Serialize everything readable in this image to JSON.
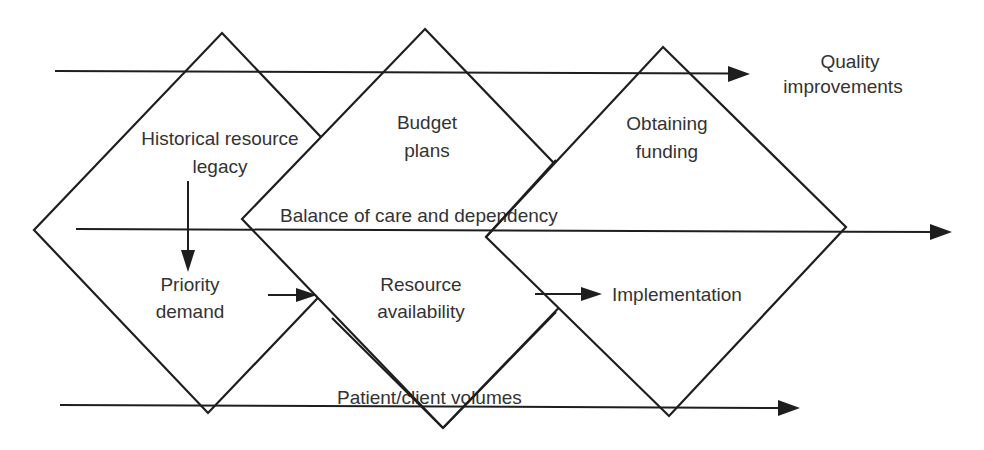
{
  "diagram": {
    "diamonds": [
      {
        "id": "historical",
        "points": "222,33 396,216 208,413 34,230",
        "label_lines": [
          "Historical resource",
          "legacy"
        ],
        "label_x": 220,
        "label_y": [
          145,
          173
        ]
      },
      {
        "id": "budget",
        "points": "425,29 626,238 443,428 242,219",
        "label_lines": [
          "Budget",
          "plans"
        ],
        "label_x": 427,
        "label_y": [
          129,
          157
        ]
      },
      {
        "id": "funding",
        "points": "663,47 846,227 669,416 486,237",
        "label_lines": [
          "Obtaining",
          "funding"
        ],
        "label_x": 667,
        "label_y": [
          130,
          158
        ]
      }
    ],
    "flow_lines": [
      {
        "id": "quality",
        "x1": 55,
        "y1": 71,
        "x2": 750,
        "y2": 74,
        "label": "Quality improvements"
      },
      {
        "id": "balance",
        "x1": 76,
        "y1": 229,
        "x2": 952,
        "y2": 232,
        "label": "Balance of care and dependency"
      },
      {
        "id": "patient",
        "x1": 60,
        "y1": 405,
        "x2": 800,
        "y2": 408,
        "label": "Patient/client volumes"
      }
    ],
    "labels": {
      "quality_line1": "Quality",
      "quality_line2": "improvements",
      "balance": "Balance of care and dependency",
      "patient": "Patient/client volumes",
      "historical_line1": "Historical resource",
      "historical_line2": "legacy",
      "budget_line1": "Budget",
      "budget_line2": "plans",
      "funding_line1": "Obtaining",
      "funding_line2": "funding",
      "priority_line1": "Priority",
      "priority_line2": "demand",
      "resource_line1": "Resource",
      "resource_line2": "availability",
      "implementation": "Implementation"
    },
    "connectors": [
      {
        "id": "legacy-to-priority",
        "x1": 188,
        "y1": 181,
        "x2": 188,
        "y2": 271
      },
      {
        "id": "priority-to-resource",
        "x1": 268,
        "y1": 295,
        "x2": 316,
        "y2": 295
      },
      {
        "id": "resource-to-implementation",
        "x1": 535,
        "y1": 294,
        "x2": 601,
        "y2": 294
      }
    ],
    "colors": {
      "stroke": "#1e1e1e",
      "text": "#333333",
      "background": "#ffffff"
    }
  }
}
